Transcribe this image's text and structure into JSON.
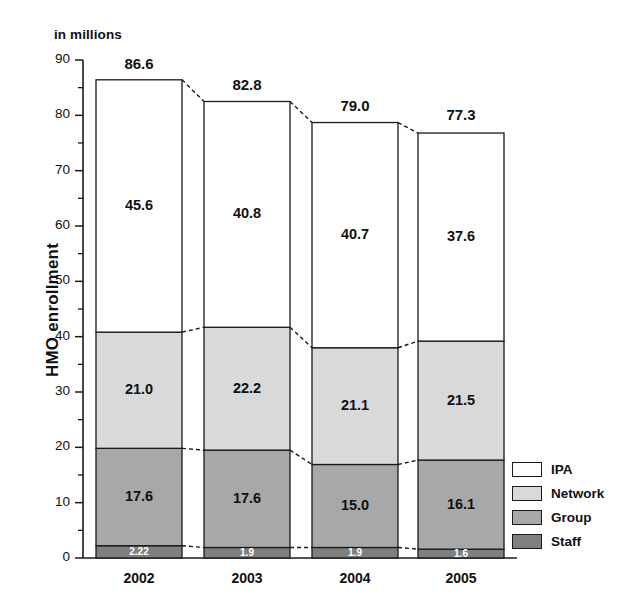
{
  "units_label": "in millions",
  "y_axis_title": "HMO enrollment",
  "legend": {
    "items": [
      {
        "label": "IPA",
        "color": "#ffffff"
      },
      {
        "label": "Network",
        "color": "#d9d9d9"
      },
      {
        "label": "Group",
        "color": "#a8a8a8"
      },
      {
        "label": "Staff",
        "color": "#7f7f7f"
      }
    ]
  },
  "chart_data": {
    "type": "bar",
    "stacked": true,
    "title": "",
    "subtitle": "in millions",
    "xlabel": "",
    "ylabel": "HMO enrollment",
    "categories": [
      "2002",
      "2003",
      "2004",
      "2005"
    ],
    "ylim": [
      0,
      90
    ],
    "yticks": [
      0,
      10,
      20,
      30,
      40,
      50,
      60,
      70,
      80,
      90
    ],
    "ytick_labels": [
      "0",
      "10",
      "20",
      "30",
      "40",
      "50",
      "60",
      "70",
      "80",
      "90"
    ],
    "minor_tick_step": 5,
    "grid": false,
    "legend_position": "right",
    "series": [
      {
        "name": "Staff",
        "color": "#7f7f7f",
        "values": [
          2.22,
          1.9,
          1.9,
          1.6
        ],
        "value_labels": [
          "2.22",
          "1.9",
          "1.9",
          "1.6"
        ]
      },
      {
        "name": "Group",
        "color": "#a8a8a8",
        "values": [
          17.6,
          17.6,
          15.0,
          16.1
        ],
        "value_labels": [
          "17.6",
          "17.6",
          "15.0",
          "16.1"
        ]
      },
      {
        "name": "Network",
        "color": "#d9d9d9",
        "values": [
          21.0,
          22.2,
          21.1,
          21.5
        ],
        "value_labels": [
          "21.0",
          "22.2",
          "21.1",
          "21.5"
        ]
      },
      {
        "name": "IPA",
        "color": "#ffffff",
        "values": [
          45.6,
          40.8,
          40.7,
          37.6
        ],
        "value_labels": [
          "45.6",
          "40.8",
          "40.7",
          "37.6"
        ]
      }
    ],
    "totals": [
      86.6,
      82.8,
      79.0,
      77.3
    ],
    "total_labels": [
      "86.6",
      "82.8",
      "79.0",
      "77.3"
    ],
    "connector_lines": "dashed segments joining equivalent stack boundaries between adjacent bars"
  }
}
